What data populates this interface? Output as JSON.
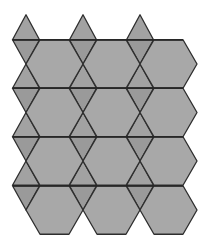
{
  "figure": {
    "colors": {
      "hexagon_fill": "#a8a8a8",
      "triangle_up_fill": "#a2a2a2",
      "triangle_down_fill": "#9a9a9a",
      "stroke": "#2e2e2e",
      "background": "#ffffff"
    },
    "hexagon_columns_center_x": [
      54.5,
      111.5,
      168.5
    ],
    "hexagon_rows_center_y": [
      64,
      112.5,
      161,
      210
    ],
    "horizontal_lines_y": [
      40,
      88,
      137,
      186
    ],
    "horizontal_line_span": [
      13,
      183
    ]
  }
}
